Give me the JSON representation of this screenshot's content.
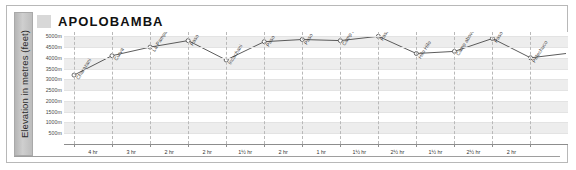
{
  "chart": {
    "title": "APOLOBAMBA",
    "y_axis_title": "Elevation in metres (feet)"
  },
  "chart_data": {
    "type": "line",
    "title": "APOLOBAMBA",
    "subtitle": "",
    "xlabel": "",
    "ylabel": "Elevation in metres (feet)",
    "ylim": [
      0,
      5200
    ],
    "grid": true,
    "legend": "none",
    "y_ticks": [
      "500m",
      "1000m",
      "1500m",
      "2000m",
      "2500m",
      "3000m",
      "3500m",
      "4000m",
      "4500m",
      "5000m"
    ],
    "y_tick_values": [
      500,
      1000,
      1500,
      2000,
      2500,
      3000,
      3500,
      4000,
      4500,
      5000
    ],
    "x_tick_labels": [
      "4 hr",
      "3 hr",
      "2 hr",
      "2 hr",
      "1½ hr",
      "2 hr",
      "1 hr",
      "1½ hr",
      "2½ hr",
      "1½ hr",
      "2½ hr",
      "2 hr"
    ],
    "point_labels": [
      "Charazani",
      "Curva",
      "La Pampa Grande",
      "Paso",
      "Incachani",
      "Paso",
      "Paso",
      "Camp above Sunchuli",
      "Paso Sunchuli",
      "Hilo Hilo",
      "Camp above Patico",
      "Paso",
      "Pelechuco"
    ],
    "values": [
      3200,
      4100,
      4500,
      4800,
      3900,
      4750,
      4850,
      4800,
      5000,
      4200,
      4300,
      4900,
      4000
    ],
    "end_value": 4200,
    "x": [
      0,
      1,
      2,
      3,
      4,
      5,
      6,
      7,
      8,
      9,
      10,
      11,
      12
    ],
    "series": [
      {
        "name": "Apolobamba trek elevation profile",
        "values": [
          3200,
          4100,
          4500,
          4800,
          3900,
          4750,
          4850,
          4800,
          5000,
          4200,
          4300,
          4900,
          4000
        ]
      }
    ]
  },
  "colors": {
    "line": "#4a4a4a",
    "marker_fill": "#ffffff",
    "band": "#ededed",
    "grid": "#b9b9b9",
    "frame": "#b8b8b8"
  }
}
